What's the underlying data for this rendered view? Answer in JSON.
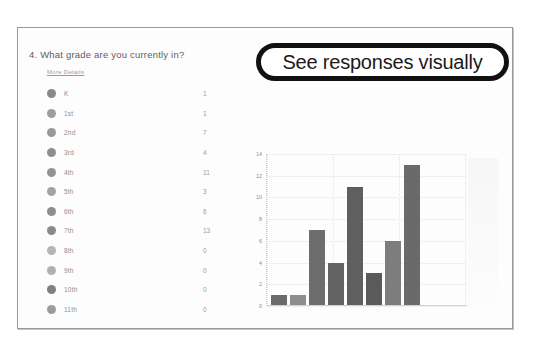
{
  "slide": {
    "callout": {
      "text": "See responses visually"
    },
    "question": {
      "number_and_text": "4.  What grade are you currently in?",
      "more_details_label": "More Details"
    },
    "results_list": {
      "rows": [
        {
          "label": "K",
          "count": "1"
        },
        {
          "label": "1st",
          "count": "1"
        },
        {
          "label": "2nd",
          "count": "7"
        },
        {
          "label": "3rd",
          "count": "4"
        },
        {
          "label": "4th",
          "count": "11"
        },
        {
          "label": "5th",
          "count": "3"
        },
        {
          "label": "6th",
          "count": "6"
        },
        {
          "label": "7th",
          "count": "13"
        },
        {
          "label": "8th",
          "count": "0"
        },
        {
          "label": "9th",
          "count": "0"
        },
        {
          "label": "10th",
          "count": "0"
        },
        {
          "label": "11th",
          "count": "0"
        }
      ]
    }
  },
  "chart_data": {
    "type": "bar",
    "title": "",
    "xlabel": "",
    "ylabel": "",
    "categories": [
      "K",
      "1st",
      "2nd",
      "3rd",
      "4th",
      "5th",
      "6th",
      "7th"
    ],
    "values": [
      1,
      1,
      7,
      4,
      11,
      3,
      6,
      13
    ],
    "ylim": [
      0,
      14
    ],
    "yticks": [
      0,
      2,
      4,
      6,
      8,
      10,
      12,
      14
    ],
    "ytick_labels": [
      "0",
      "2",
      "4",
      "6",
      "8",
      "10",
      "12",
      "14"
    ],
    "grid": true,
    "legend": "none",
    "bar_color": "#6f6f6f"
  }
}
